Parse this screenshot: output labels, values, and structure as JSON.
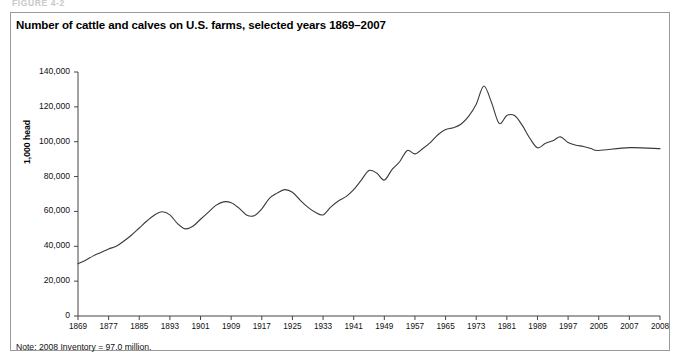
{
  "figure_caption": "FIGURE 4-2",
  "note": "Note: 2008 Inventory = 97.0 million.",
  "chart_data": {
    "type": "line",
    "title": "Number of cattle and calves on U.S. farms, selected years 1869–2007",
    "xlabel": "",
    "ylabel": "1,000 head",
    "ylim": [
      0,
      140000
    ],
    "yticks": [
      0,
      20000,
      40000,
      60000,
      80000,
      100000,
      120000,
      140000
    ],
    "ytick_labels": [
      "0",
      "20,000",
      "40,000",
      "60,000",
      "80,000",
      "100,000",
      "120,000",
      "140,000"
    ],
    "xtick_labels": [
      "1869",
      "1877",
      "1885",
      "1893",
      "1901",
      "1909",
      "1917",
      "1925",
      "1933",
      "1941",
      "1949",
      "1957",
      "1965",
      "1973",
      "1981",
      "1989",
      "1997",
      "2005",
      "2007",
      "2008"
    ],
    "grid": false,
    "legend": "none",
    "series": [
      {
        "name": "Cattle and calves on U.S. farms",
        "units": "1,000 head",
        "x": [
          1869,
          1871,
          1873,
          1875,
          1877,
          1879,
          1881,
          1883,
          1885,
          1887,
          1889,
          1891,
          1893,
          1895,
          1897,
          1899,
          1901,
          1903,
          1905,
          1907,
          1909,
          1911,
          1913,
          1915,
          1917,
          1919,
          1921,
          1923,
          1925,
          1927,
          1929,
          1931,
          1933,
          1935,
          1937,
          1939,
          1941,
          1943,
          1945,
          1947,
          1949,
          1951,
          1953,
          1955,
          1957,
          1959,
          1961,
          1963,
          1965,
          1967,
          1969,
          1971,
          1973,
          1975,
          1977,
          1979,
          1981,
          1983,
          1985,
          1987,
          1989,
          1991,
          1993,
          1995,
          1997,
          1999,
          2001,
          2003,
          2005,
          2007,
          2008
        ],
        "values": [
          30000,
          32000,
          34500,
          36500,
          38500,
          40000,
          43000,
          46500,
          50500,
          54500,
          58000,
          59800,
          58000,
          53000,
          50000,
          51500,
          55500,
          59500,
          63500,
          65500,
          65000,
          62000,
          58000,
          57500,
          61500,
          67500,
          70500,
          72500,
          71000,
          66500,
          62500,
          59500,
          58000,
          62500,
          66000,
          68500,
          72500,
          78000,
          83500,
          82000,
          78000,
          84000,
          88500,
          95000,
          93000,
          96000,
          99500,
          104000,
          107000,
          108000,
          110000,
          114500,
          121500,
          132000,
          122500,
          110500,
          115000,
          115000,
          109500,
          102000,
          96500,
          99000,
          100500,
          102800,
          99500,
          98000,
          97300,
          96100,
          95000,
          96600,
          96035
        ]
      }
    ],
    "annotations": {
      "peak_year": 1975,
      "peak_value": 132000,
      "start_year": 1869,
      "start_value": 30000,
      "end_year": 2008,
      "end_value": 97000
    }
  }
}
